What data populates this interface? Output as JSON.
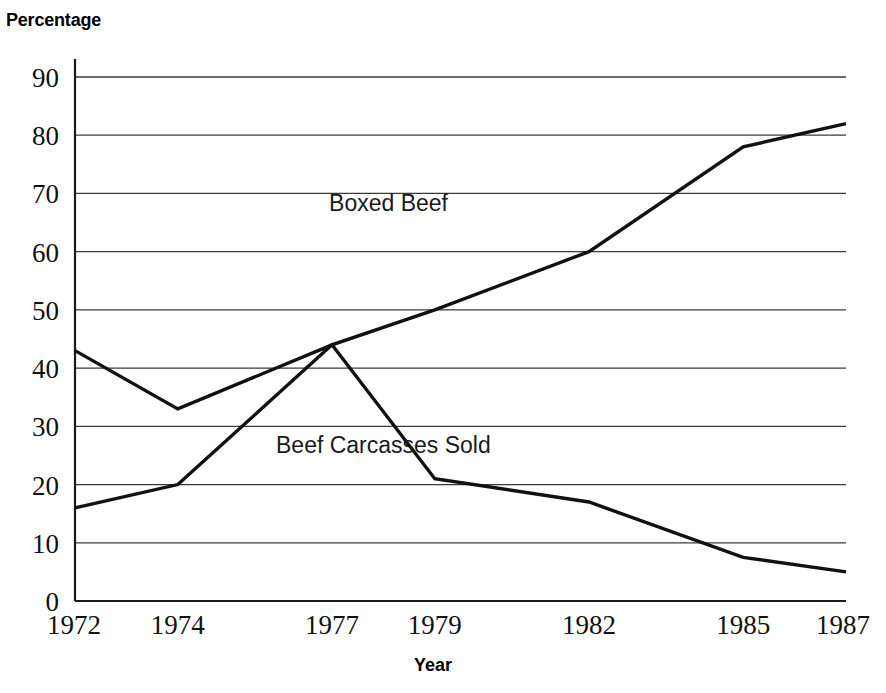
{
  "chart_data": {
    "type": "line",
    "title": "",
    "xlabel": "Year",
    "ylabel": "Percentage",
    "x": [
      1972,
      1974,
      1977,
      1979,
      1982,
      1985,
      1987
    ],
    "xtick_labels": [
      "1972",
      "1974",
      "1977",
      "1979",
      "1982",
      "1985",
      "1987"
    ],
    "ytick_labels": [
      "0",
      "10",
      "20",
      "30",
      "40",
      "50",
      "60",
      "70",
      "80",
      "90"
    ],
    "yticks": [
      0,
      10,
      20,
      30,
      40,
      50,
      60,
      70,
      80,
      90
    ],
    "ylim": [
      0,
      90
    ],
    "xlim": [
      1972,
      1987
    ],
    "grid": "horizontal",
    "legend_position": "inline-annotation",
    "series": [
      {
        "name": "Boxed Beef",
        "values": [
          16,
          20,
          44,
          50,
          60,
          78,
          82
        ],
        "color": "#111111",
        "label_x": 1978.1,
        "label_y": 67
      },
      {
        "name": "Beef Carcasses Sold",
        "values": [
          43,
          33,
          44,
          21,
          17,
          7.5,
          5
        ],
        "color": "#111111",
        "label_x": 1978.0,
        "label_y": 25.5
      }
    ]
  },
  "axes": {
    "y_title": "Percentage",
    "x_title": "Year"
  },
  "annotations": {
    "boxed_beef_label": "Boxed Beef",
    "beef_carcasses_label": "Beef Carcasses Sold"
  }
}
